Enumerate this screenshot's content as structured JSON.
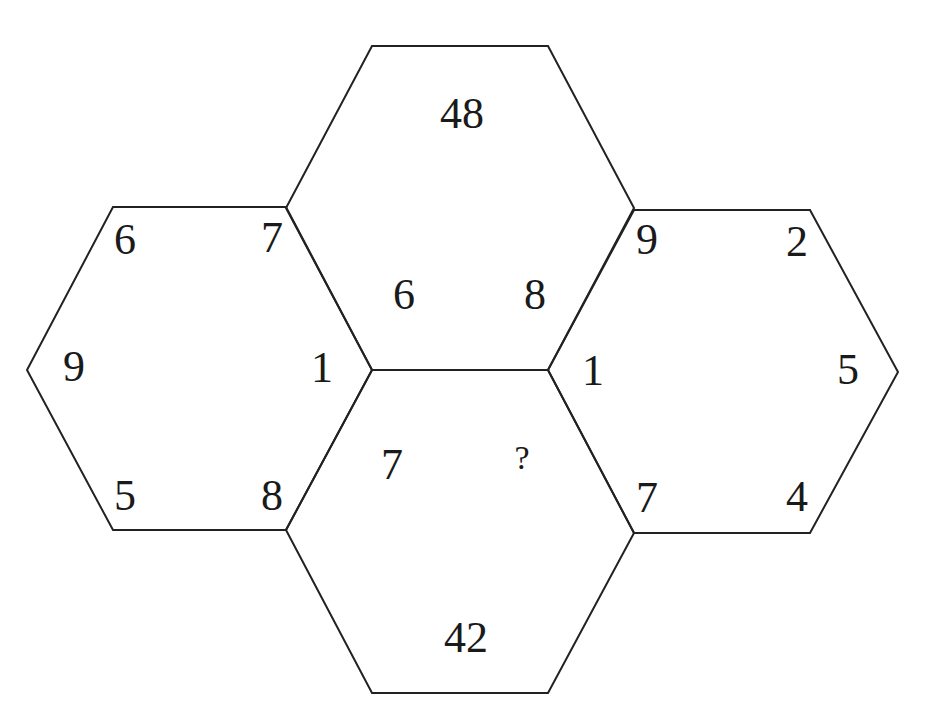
{
  "puzzle": {
    "type": "hexagon number puzzle",
    "stroke_color": "#222222",
    "text_color": "#1a1a1a",
    "background": "#ffffff",
    "hexagons": {
      "top": {
        "total": "48",
        "inner_left": "6",
        "inner_right": "8"
      },
      "bottom": {
        "total": "42",
        "inner_left": "7",
        "inner_right": "?"
      },
      "left": {
        "top_left": "6",
        "top_right": "7",
        "middle_left": "9",
        "middle_right": "1",
        "bottom_left": "5",
        "bottom_right": "8"
      },
      "right": {
        "top_left": "9",
        "top_right": "2",
        "middle_left": "1",
        "middle_right": "5",
        "bottom_left": "7",
        "bottom_right": "4"
      }
    }
  }
}
